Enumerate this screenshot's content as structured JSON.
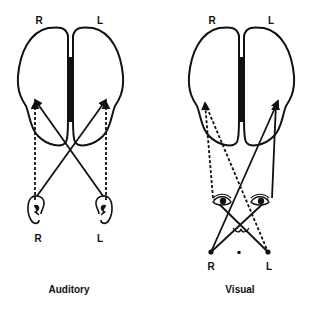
{
  "figure": {
    "panels": [
      {
        "id": "auditory",
        "caption": "Auditory",
        "hemisphere_labels": {
          "right": "R",
          "left": "L"
        },
        "sensor_labels": {
          "right": "R",
          "left": "L"
        },
        "sensor_type": "ears"
      },
      {
        "id": "visual",
        "caption": "Visual",
        "hemisphere_labels": {
          "right": "R",
          "left": "L"
        },
        "sensor_labels": {
          "right": "R",
          "left": "L"
        },
        "sensor_type": "eyes",
        "fixation_marker": "x"
      }
    ],
    "line_styles": {
      "ipsilateral": "dashed",
      "contralateral": "solid"
    },
    "colors": {
      "ink": "#111111",
      "background": "#ffffff"
    }
  }
}
